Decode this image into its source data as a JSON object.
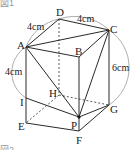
{
  "figure": {
    "caption_top": "図1",
    "caption_bottom": "図2",
    "vertices": {
      "A": "A",
      "B": "B",
      "C": "C",
      "D": "D",
      "E": "E",
      "F": "F",
      "G": "G",
      "H": "H",
      "I": "I",
      "P": "P"
    },
    "dimensions": {
      "AD": "4cm",
      "DC": "4cm",
      "AI": "4cm",
      "CG": "6cm"
    },
    "colors": {
      "line": "#2a2a2a",
      "arc": "#999999"
    }
  }
}
